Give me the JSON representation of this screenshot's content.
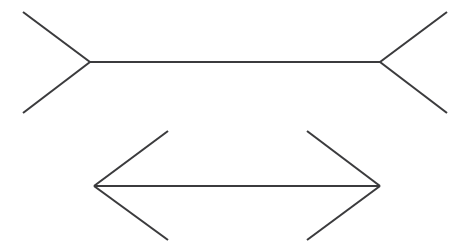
{
  "figure": {
    "name": "Müller-Lyer illusion",
    "type": "line-diagram",
    "canvas": {
      "width": 470,
      "height": 245,
      "background": "#ffffff"
    },
    "style": {
      "line_color": "#3b3b3d",
      "line_width": 2.1,
      "line_cap": "butt"
    },
    "shafts": [
      {
        "id": "top-shaft",
        "label": "upper horizontal shaft",
        "x1": 90,
        "y1": 62,
        "x2": 380,
        "y2": 62,
        "length_px": 290,
        "fin_direction": "outward"
      },
      {
        "id": "bottom-shaft",
        "label": "lower horizontal shaft",
        "x1": 94,
        "y1": 186,
        "x2": 380,
        "y2": 186,
        "length_px": 286,
        "fin_direction": "inward"
      }
    ],
    "fins": [
      {
        "id": "top-left-upper-fin",
        "label": "upper figure, left vertex, upper outward fin",
        "x1": 90,
        "y1": 62,
        "x2": 23,
        "y2": 12
      },
      {
        "id": "top-left-lower-fin",
        "label": "upper figure, left vertex, lower outward fin",
        "x1": 90,
        "y1": 62,
        "x2": 23,
        "y2": 113
      },
      {
        "id": "top-right-upper-fin",
        "label": "upper figure, right vertex, upper outward fin",
        "x1": 380,
        "y1": 62,
        "x2": 447,
        "y2": 12
      },
      {
        "id": "top-right-lower-fin",
        "label": "upper figure, right vertex, lower outward fin",
        "x1": 380,
        "y1": 62,
        "x2": 447,
        "y2": 113
      },
      {
        "id": "bottom-left-upper-fin",
        "label": "lower figure, left vertex, upper inward fin",
        "x1": 94,
        "y1": 186,
        "x2": 168,
        "y2": 131
      },
      {
        "id": "bottom-left-lower-fin",
        "label": "lower figure, left vertex, lower inward fin",
        "x1": 94,
        "y1": 186,
        "x2": 168,
        "y2": 240
      },
      {
        "id": "bottom-right-upper-fin",
        "label": "lower figure, right vertex, upper inward fin",
        "x1": 380,
        "y1": 186,
        "x2": 307,
        "y2": 131
      },
      {
        "id": "bottom-right-lower-fin",
        "label": "lower figure, right vertex, lower inward fin",
        "x1": 380,
        "y1": 186,
        "x2": 307,
        "y2": 240
      }
    ]
  }
}
